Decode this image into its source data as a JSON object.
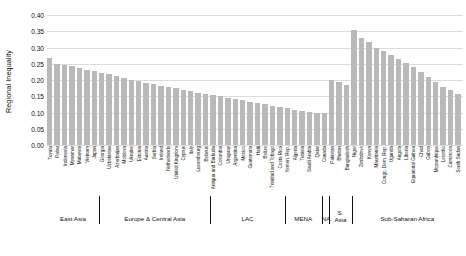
{
  "chart_data": {
    "type": "bar",
    "title": "",
    "xlabel": "",
    "ylabel": "Regional Inequality",
    "ylim": [
      0.0,
      0.4
    ],
    "yticks": [
      "0.00",
      "0.05",
      "0.10",
      "0.15",
      "0.20",
      "0.25",
      "0.30",
      "0.35",
      "0.40"
    ],
    "ytick_values": [
      0.0,
      0.05,
      0.1,
      0.15,
      0.2,
      0.25,
      0.3,
      0.35,
      0.4
    ],
    "grid": true,
    "legend": "none",
    "bar_color": "#b9b9b9",
    "grid_color": "#dcdcdc",
    "categories": [
      "Tuvalu",
      "Palau",
      "Indonesia",
      "Myanmar",
      "Malaysia",
      "Vietnam",
      "Japan",
      "Georgia",
      "Uzbekistan",
      "Azerbaijan",
      "Moldova",
      "Ukraine",
      "Estonia",
      "Austria",
      "Serbia",
      "Ireland",
      "Netherlands",
      "United Kingdom",
      "Cyprus",
      "Italy",
      "Luxembourg",
      "Belarus",
      "Antigua and Barbuda",
      "Colombia",
      "Uruguay",
      "Argentina",
      "Mexico",
      "Guatemala",
      "Haiti",
      "Belize",
      "Trinidad and Tobago",
      "Costa Rica",
      "Yemen, Rep.",
      "Algeria",
      "Tunisia",
      "Saudi Arabia",
      "Qatar",
      "Canada",
      "Pakistan",
      "Bhutan",
      "Bangladesh",
      "Niger",
      "Zimbabwe",
      "Kenya",
      "Mauritania",
      "Congo, Dem. Rep.",
      "Uganda",
      "Angola",
      "Liberia",
      "Equatorial Guinea",
      "Chad",
      "Gabon",
      "Mozambique",
      "Lesotho",
      "Cameroon",
      "South Sudan"
    ],
    "values": [
      0.267,
      0.25,
      0.247,
      0.243,
      0.237,
      0.232,
      0.228,
      0.223,
      0.218,
      0.213,
      0.207,
      0.2,
      0.196,
      0.192,
      0.188,
      0.183,
      0.178,
      0.174,
      0.17,
      0.166,
      0.161,
      0.157,
      0.153,
      0.15,
      0.146,
      0.142,
      0.138,
      0.133,
      0.129,
      0.125,
      0.121,
      0.117,
      0.113,
      0.109,
      0.105,
      0.101,
      0.1,
      0.1,
      0.2,
      0.193,
      0.186,
      0.355,
      0.33,
      0.318,
      0.3,
      0.288,
      0.276,
      0.264,
      0.251,
      0.24,
      0.224,
      0.208,
      0.193,
      0.18,
      0.168,
      0.157
    ],
    "region_groups": [
      {
        "label": "East Asia",
        "start": 0,
        "end": 6
      },
      {
        "label": "Europe & Central Asia",
        "start": 7,
        "end": 21
      },
      {
        "label": "LAC",
        "start": 22,
        "end": 31
      },
      {
        "label": "MENA",
        "start": 32,
        "end": 36
      },
      {
        "label": "NA",
        "start": 37,
        "end": 37
      },
      {
        "label": "S. Asia",
        "start": 38,
        "end": 40
      },
      {
        "label": "Sub-Saharan Africa",
        "start": 41,
        "end": 55
      }
    ]
  }
}
